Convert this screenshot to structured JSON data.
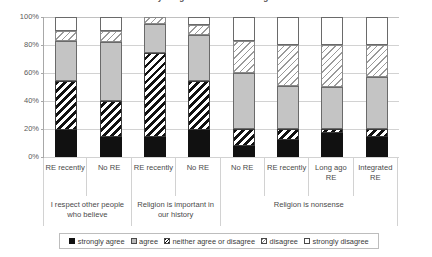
{
  "chart_data": {
    "type": "bar",
    "title": "How far do you agree with the following statements?",
    "xlabel": "",
    "ylabel": "",
    "ylim": [
      0,
      100
    ],
    "ytick_labels": [
      "0%",
      "20%",
      "40%",
      "60%",
      "80%",
      "100%"
    ],
    "ytick_values": [
      0,
      20,
      40,
      60,
      80,
      100
    ],
    "grid": true,
    "stacked": true,
    "normalized_percent": true,
    "legend_position": "bottom",
    "stack_order_bottom_to_top": [
      "strongly agree",
      "neither agree or disagree",
      "agree",
      "disagree",
      "strongly disagree"
    ],
    "legend_entries": [
      {
        "label": "strongly agree",
        "pattern": "solid-black",
        "color": "#111111"
      },
      {
        "label": "agree",
        "pattern": "solid-gray",
        "color": "#c4c4c4"
      },
      {
        "label": "neither agree or disagree",
        "pattern": "bold-diagonal-hatch",
        "color": "#ffffff"
      },
      {
        "label": "disagree",
        "pattern": "light-diagonal-hatch",
        "color": "#ffffff"
      },
      {
        "label": "strongly disagree",
        "pattern": "solid-white",
        "color": "#ffffff"
      }
    ],
    "categories": [
      "RE recently",
      "No RE",
      "RE recently",
      "No RE",
      "No RE",
      "RE recently",
      "Long ago RE",
      "Integrated RE"
    ],
    "groups": [
      {
        "label": "I respect other people who believe",
        "span": 2
      },
      {
        "label": "Religion is important in our history",
        "span": 2
      },
      {
        "label": "Religion is nonsense",
        "span": 4
      }
    ],
    "series": [
      {
        "name": "strongly agree",
        "values": [
          19,
          14,
          14,
          19,
          8,
          12,
          17,
          14
        ]
      },
      {
        "name": "neither agree or disagree",
        "values": [
          35,
          26,
          60,
          35,
          12,
          8,
          3,
          6
        ]
      },
      {
        "name": "agree",
        "values": [
          29,
          42,
          21,
          33,
          40,
          31,
          30,
          37
        ]
      },
      {
        "name": "disagree",
        "values": [
          7,
          8,
          5,
          7,
          23,
          29,
          30,
          23
        ]
      },
      {
        "name": "strongly disagree",
        "values": [
          10,
          10,
          0,
          6,
          17,
          20,
          20,
          20
        ]
      }
    ]
  }
}
